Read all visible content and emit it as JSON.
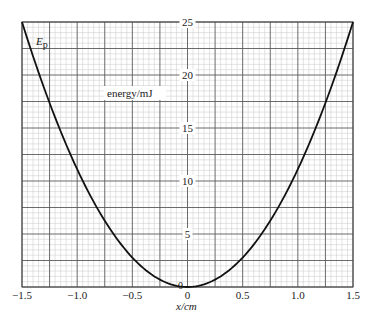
{
  "chart_data": {
    "type": "line",
    "title": "",
    "curve_label": "E",
    "curve_label_sub": "p",
    "ylabel": "energy/mJ",
    "xlabel": "x/cm",
    "xlim": [
      -1.5,
      1.5
    ],
    "ylim": [
      0,
      25
    ],
    "x_ticks": [
      -1.5,
      -1.0,
      -0.5,
      0,
      0.5,
      1.0,
      1.5
    ],
    "x_tick_labels": [
      "−1.5",
      "−1.0",
      "−0.5",
      "0",
      "0.5",
      "1.0",
      "1.5"
    ],
    "y_ticks": [
      5,
      10,
      15,
      20,
      25
    ],
    "y_tick_labels": [
      "5",
      "10",
      "15",
      "20",
      "25"
    ],
    "origin_label": "0",
    "grid": true,
    "grid_major_x_step": 0.25,
    "grid_major_y_step": 2.5,
    "grid_minor_divisions": 5,
    "legend": "none",
    "series": [
      {
        "name": "Ep",
        "equation": "E = 11.11 x^2",
        "x": [
          -1.5,
          -1.25,
          -1.0,
          -0.75,
          -0.5,
          -0.25,
          0,
          0.25,
          0.5,
          0.75,
          1.0,
          1.25,
          1.5
        ],
        "values": [
          25.0,
          17.4,
          11.1,
          6.25,
          2.78,
          0.69,
          0,
          0.69,
          2.78,
          6.25,
          11.1,
          17.4,
          25.0
        ]
      }
    ]
  },
  "colors": {
    "minor_grid": "#c8c8c8",
    "major_grid": "#5a5a5a",
    "curve": "#111111",
    "text": "#222222"
  }
}
